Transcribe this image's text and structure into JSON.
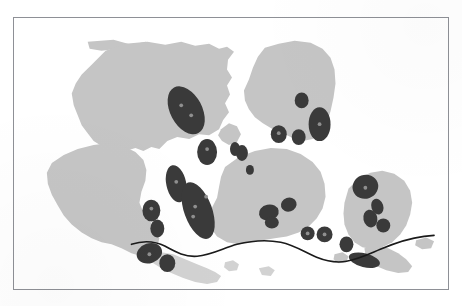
{
  "figure": {
    "kind": "scanned-map-plate",
    "header_text_fragment": "",
    "frame": {
      "x": 13,
      "y": 17,
      "width": 436,
      "height": 273
    },
    "viewbox": {
      "width": 436,
      "height": 273
    }
  },
  "colors": {
    "page_background": "#ffffff",
    "frame_border": "#8e9096",
    "landmass_fill": "#c5c5c5",
    "landmass_fill_light": "#d2d2d2",
    "patch_fill": "#3a3a3a",
    "patch_core": "#8f8f8f",
    "boundary_line": "#1a1a1a",
    "header_text": "#d8d8dc"
  },
  "legend_implied": {
    "landmass_label": "land area",
    "patch_label": "distribution area",
    "line_label": "boundary line"
  },
  "map_data": {
    "landmasses": [
      {
        "name": "northwest-landmass",
        "fill": "#c5c5c5",
        "path": "M 74 24 L 100 22 L 118 27 L 132 24 L 140 26 L 135 31 L 118 33 L 104 31 L 88 33 L 76 31 Z"
      },
      {
        "name": "north-central-landmass",
        "fill": "#c5c5c5",
        "path": "M 78 47 L 92 33 L 112 26 L 134 24 L 152 27 L 168 24 L 182 28 L 196 26 L 206 31 L 214 29 L 221 34 L 215 42 L 214 52 L 219 60 L 214 68 L 217 77 L 212 86 L 216 95 L 210 103 L 206 112 L 196 118 L 186 117 L 176 122 L 164 120 L 154 124 L 146 132 L 138 130 L 130 134 L 122 131 L 112 134 L 104 131 L 96 127 L 88 129 L 80 124 L 74 116 L 68 108 L 64 98 L 60 88 L 58 76 L 62 66 L 68 57 Z"
      },
      {
        "name": "northeast-landmass",
        "fill": "#c5c5c5",
        "path": "M 252 30 L 266 26 L 282 23 L 298 25 L 310 31 L 318 40 L 322 52 L 323 66 L 321 80 L 318 94 L 314 106 L 308 116 L 300 122 L 290 124 L 280 121 L 270 116 L 260 112 L 250 106 L 242 100 L 236 92 L 232 83 L 231 73 L 236 62 L 240 50 L 245 39 Z"
      },
      {
        "name": "east-horn-landmass",
        "fill": "#c5c5c5",
        "path": "M 208 112 L 216 106 L 224 109 L 228 117 L 224 125 L 216 128 L 209 124 L 205 118 Z"
      },
      {
        "name": "southwest-landmass",
        "fill": "#c5c5c5",
        "path": "M 38 146 L 50 138 L 64 132 L 80 128 L 96 126 L 110 129 L 122 135 L 130 143 L 133 153 L 132 164 L 128 175 L 126 186 L 130 196 L 136 204 L 142 212 L 146 222 L 144 231 L 138 238 L 128 240 L 118 237 L 108 232 L 98 228 L 88 226 L 78 222 L 68 216 L 58 208 L 50 199 L 44 189 L 38 178 L 34 167 L 33 156 Z"
      },
      {
        "name": "south-central-landmass",
        "fill": "#c5c5c5",
        "path": "M 212 150 L 226 140 L 242 134 L 258 131 L 274 132 L 288 137 L 300 145 L 308 155 L 312 167 L 313 180 L 310 192 L 304 202 L 296 210 L 286 216 L 274 220 L 262 222 L 250 224 L 238 226 L 226 228 L 214 226 L 204 220 L 198 212 L 196 202 L 199 191 L 204 181 L 206 170 L 208 160 Z"
      },
      {
        "name": "southeast-landmass",
        "fill": "#c5c5c5",
        "path": "M 336 172 L 346 162 L 358 156 L 370 154 L 382 157 L 392 164 L 398 174 L 400 186 L 398 198 L 394 209 L 388 218 L 380 226 L 370 231 L 360 233 L 350 231 L 342 226 L 336 218 L 332 208 L 331 197 L 332 186 Z"
      },
      {
        "name": "south-island-arc-central",
        "fill": "#d2d2d2",
        "path": "M 136 240 L 148 236 L 160 238 L 172 243 L 184 248 L 194 252 L 202 256 L 208 260 L 204 266 L 194 268 L 182 266 L 170 262 L 158 257 L 148 252 L 140 247 Z"
      },
      {
        "name": "south-island-arc-east",
        "fill": "#c5c5c5",
        "path": "M 352 232 L 364 230 L 376 232 L 386 237 L 394 243 L 400 250 L 396 256 L 386 257 L 374 254 L 362 249 L 354 243 Z"
      },
      {
        "name": "small-island-a",
        "fill": "#d2d2d2",
        "path": "M 212 246 L 220 244 L 226 248 L 224 254 L 216 255 L 211 251 Z"
      },
      {
        "name": "small-island-b",
        "fill": "#c5c5c5",
        "path": "M 322 238 L 330 236 L 336 240 L 334 246 L 326 247 L 321 243 Z"
      },
      {
        "name": "small-island-c",
        "fill": "#c5c5c5",
        "path": "M 404 224 L 414 221 L 422 225 L 419 232 L 410 233 L 403 229 Z"
      },
      {
        "name": "small-island-d",
        "fill": "#d2d2d2",
        "path": "M 246 252 L 256 250 L 262 254 L 258 260 L 249 259 Z"
      }
    ],
    "patches": [
      {
        "name": "patch-01",
        "cx": 173,
        "cy": 93,
        "rx": 16,
        "ry": 26,
        "rot": -28,
        "cores": [
          [
            168,
            88
          ],
          [
            178,
            98
          ]
        ]
      },
      {
        "name": "patch-02",
        "cx": 194,
        "cy": 135,
        "rx": 10,
        "ry": 13,
        "rot": 0,
        "cores": [
          [
            194,
            132
          ]
        ]
      },
      {
        "name": "patch-03",
        "cx": 229,
        "cy": 136,
        "rx": 6,
        "ry": 8,
        "rot": 0,
        "cores": []
      },
      {
        "name": "patch-04",
        "cx": 163,
        "cy": 167,
        "rx": 10,
        "ry": 19,
        "rot": -12,
        "cores": [
          [
            163,
            165
          ]
        ]
      },
      {
        "name": "patch-05",
        "cx": 185,
        "cy": 194,
        "rx": 14,
        "ry": 30,
        "rot": -20,
        "cores": [
          [
            182,
            190
          ],
          [
            193,
            180
          ],
          [
            180,
            200
          ]
        ]
      },
      {
        "name": "patch-06",
        "cx": 138,
        "cy": 194,
        "rx": 9,
        "ry": 11,
        "rot": 0,
        "cores": [
          [
            138,
            192
          ]
        ]
      },
      {
        "name": "patch-07",
        "cx": 144,
        "cy": 212,
        "rx": 7,
        "ry": 9,
        "rot": 0,
        "cores": []
      },
      {
        "name": "patch-08",
        "cx": 136,
        "cy": 237,
        "rx": 13,
        "ry": 10,
        "rot": -18,
        "cores": [
          [
            136,
            238
          ]
        ]
      },
      {
        "name": "patch-09",
        "cx": 154,
        "cy": 247,
        "rx": 8,
        "ry": 9,
        "rot": 0,
        "cores": []
      },
      {
        "name": "patch-10",
        "cx": 289,
        "cy": 83,
        "rx": 7,
        "ry": 8,
        "rot": 0,
        "cores": []
      },
      {
        "name": "patch-11",
        "cx": 307,
        "cy": 107,
        "rx": 11,
        "ry": 17,
        "rot": 0,
        "cores": [
          [
            307,
            107
          ]
        ]
      },
      {
        "name": "patch-12",
        "cx": 266,
        "cy": 117,
        "rx": 8,
        "ry": 9,
        "rot": 0,
        "cores": [
          [
            266,
            116
          ]
        ]
      },
      {
        "name": "patch-13",
        "cx": 286,
        "cy": 120,
        "rx": 7,
        "ry": 8,
        "rot": 0,
        "cores": []
      },
      {
        "name": "patch-14",
        "cx": 237,
        "cy": 153,
        "rx": 4,
        "ry": 5,
        "rot": 0,
        "cores": []
      },
      {
        "name": "patch-15",
        "cx": 222,
        "cy": 132,
        "rx": 5,
        "ry": 7,
        "rot": 0,
        "cores": []
      },
      {
        "name": "patch-16",
        "cx": 256,
        "cy": 196,
        "rx": 10,
        "ry": 8,
        "rot": -12,
        "cores": []
      },
      {
        "name": "patch-17",
        "cx": 276,
        "cy": 188,
        "rx": 8,
        "ry": 7,
        "rot": -18,
        "cores": []
      },
      {
        "name": "patch-18",
        "cx": 259,
        "cy": 206,
        "rx": 7,
        "ry": 6,
        "rot": 0,
        "cores": []
      },
      {
        "name": "patch-19",
        "cx": 295,
        "cy": 217,
        "rx": 7,
        "ry": 7,
        "rot": 0,
        "cores": [
          [
            295,
            217
          ]
        ]
      },
      {
        "name": "patch-20",
        "cx": 312,
        "cy": 218,
        "rx": 8,
        "ry": 8,
        "rot": 0,
        "cores": [
          [
            312,
            218
          ]
        ]
      },
      {
        "name": "patch-21",
        "cx": 353,
        "cy": 170,
        "rx": 13,
        "ry": 12,
        "rot": -20,
        "cores": [
          [
            353,
            171
          ]
        ]
      },
      {
        "name": "patch-22",
        "cx": 365,
        "cy": 190,
        "rx": 6,
        "ry": 8,
        "rot": -18,
        "cores": []
      },
      {
        "name": "patch-23",
        "cx": 358,
        "cy": 202,
        "rx": 7,
        "ry": 9,
        "rot": -12,
        "cores": []
      },
      {
        "name": "patch-24",
        "cx": 371,
        "cy": 209,
        "rx": 7,
        "ry": 7,
        "rot": 0,
        "cores": []
      },
      {
        "name": "patch-25",
        "cx": 334,
        "cy": 228,
        "rx": 7,
        "ry": 8,
        "rot": 0,
        "cores": []
      },
      {
        "name": "patch-26",
        "cx": 352,
        "cy": 244,
        "rx": 16,
        "ry": 7,
        "rot": 14,
        "cores": []
      }
    ],
    "boundary_line": {
      "name": "boundary-line",
      "stroke": "#1a1a1a",
      "width": 1.6,
      "path": "M 118 228 C 130 224 142 225 152 230 C 163 236 172 241 184 240 C 198 239 210 232 224 228 C 240 224 254 223 268 226 C 282 229 292 236 304 241 C 314 245 324 247 334 245 C 346 243 356 238 368 233 C 382 227 396 222 412 220 L 422 219"
    }
  }
}
